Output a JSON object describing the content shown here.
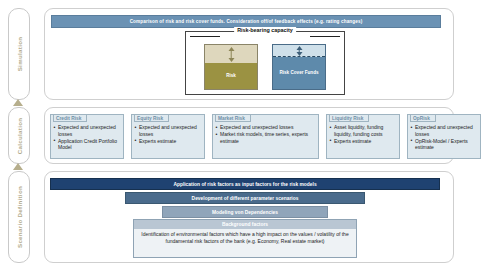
{
  "rail": {
    "items": [
      {
        "label": "Simulation"
      },
      {
        "label": "Calculation"
      },
      {
        "label": "Scenario Definition"
      }
    ]
  },
  "simulation": {
    "banner": "Comparison of risk and risk cover funds. Consideration off/of feedback effects (e.g. rating changes)",
    "risk_bearing_capacity": {
      "title": "Risk-bearing capacity",
      "columns": [
        {
          "label": "Risk",
          "top_color": "#ded7bd",
          "bottom_color": "#9b9242"
        },
        {
          "label": "Risk Cover Funds",
          "top_color": "#cfe0ea",
          "bottom_color": "#5e8aab"
        }
      ]
    }
  },
  "calculation": {
    "cards": [
      {
        "title": "Credit Risk",
        "bullets": [
          "Expected and unexpected losses",
          "Application Credit Portfolio Model"
        ]
      },
      {
        "title": "Equity Risk",
        "bullets": [
          "Expected and unexpected losses",
          "Experts estimate"
        ]
      },
      {
        "title": "Market Risk",
        "bullets": [
          "Expected and unexpected losses",
          "Market risk models, time series, experts estimate"
        ]
      },
      {
        "title": "Liquidity Risk",
        "bullets": [
          "Asset liquidity, funding liquidity, funding costs",
          "Experts estimate"
        ]
      },
      {
        "title": "OpRisk",
        "bullets": [
          "Expected and unexpected losses",
          "OpRisk-Model / Experts estimate"
        ]
      }
    ]
  },
  "scenario_definition": {
    "bars": [
      {
        "label": "Application of risk factors as input factors for the risk models",
        "color": "#1f4271"
      },
      {
        "label": "Development of different parameter scenarios",
        "color": "#4a6b8c"
      },
      {
        "label": "Modeling von Dependencies",
        "color": "#90a5ba"
      }
    ],
    "background_factors": {
      "title": "Background factors",
      "text": "Identification of environmental factors which have a high impact on the values / volatility of the fundamental risk factors of the bank (e.g. Economy,  Real estate market)"
    }
  }
}
